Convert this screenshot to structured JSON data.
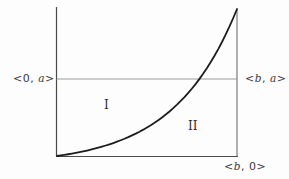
{
  "figure": {
    "labels": {
      "left_endpoint": "<0, a>",
      "right_endpoint": "<b, a>",
      "bottom_endpoint": "<b, 0>",
      "region_one": "I",
      "region_two": "II"
    },
    "colors": {
      "background": "#fdfdfd",
      "axis": "#4a4a4a",
      "right_boundary": "#6f6f6f",
      "guide": "#9b9b9b",
      "curve": "#1d1d1d",
      "text": "#3a3a3a"
    },
    "geometry": {
      "axis_x": 56.5,
      "axis_top_y": 7,
      "bottom_y": 156.5,
      "bottom_right_x": 238,
      "right_x": 237,
      "right_top_y": 9,
      "guide_y": 79,
      "curve": {
        "type": "exponential",
        "start_x": 57,
        "start_y": 156,
        "end_x": 237,
        "end_y": 9,
        "k": 2.85,
        "samples": 48,
        "guide_crossing_x": 198
      }
    }
  }
}
